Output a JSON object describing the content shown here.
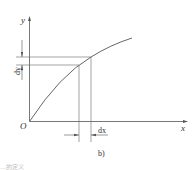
{
  "diagram": {
    "origin_label": "O",
    "x_axis_label": "x",
    "y_axis_label": "y",
    "dx_label": "dx",
    "dy_label": "dy",
    "subfigure_label": "b)",
    "bottom_text": "…的定义",
    "colors": {
      "line": "#555555",
      "text": "#333333",
      "background": "#ffffff"
    }
  }
}
